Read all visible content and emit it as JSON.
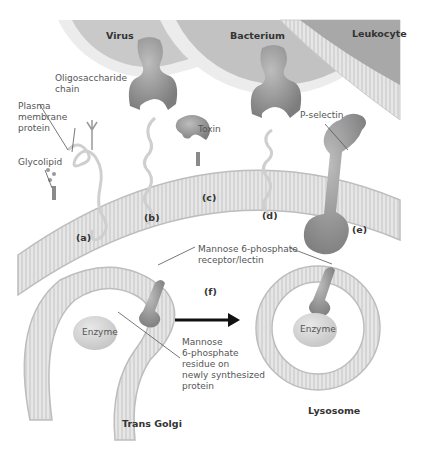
{
  "figure": {
    "cells": {
      "virus": "Virus",
      "bacterium": "Bacterium",
      "leukocyte": "Leukocyte",
      "trans_golgi": "Trans Golgi",
      "lysosome": "Lysosome"
    },
    "labels": {
      "oligosaccharide_chain": "Oligosaccharide\nchain",
      "plasma_membrane_protein": "Plasma\nmembrane\nprotein",
      "glycolipid": "Glycolipid",
      "toxin": "Toxin",
      "p_selectin": "P-selectin",
      "m6p_receptor": "Mannose 6-phosphate\nreceptor/lectin",
      "m6p_residue": "Mannose\n6-phosphate\nresidue on\nnewly synthesized\nprotein",
      "enzyme_golgi": "Enzyme",
      "enzyme_lysosome": "Enzyme"
    },
    "panels": [
      "(a)",
      "(b)",
      "(c)",
      "(d)",
      "(e)",
      "(f)"
    ],
    "colors": {
      "membrane": "#d4d4d4",
      "protein_dark": "#8c8c8c",
      "cell_fill": "#c8c8c8",
      "background": "#ffffff"
    }
  }
}
